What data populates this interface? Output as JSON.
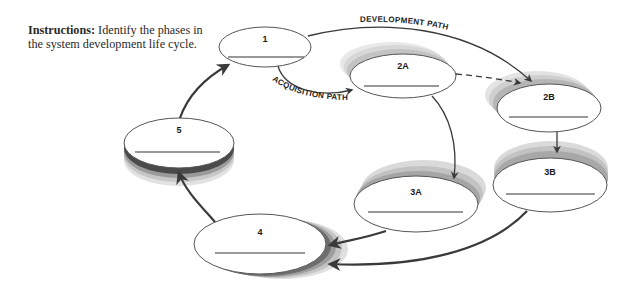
{
  "instructions": {
    "label": "Instructions:",
    "text": " Identify the phases in the system development life cycle."
  },
  "paths": {
    "development": "DEVELOPMENT PATH",
    "acquisition": "ACQUISITION PATH"
  },
  "phases": [
    {
      "id": "1",
      "answer": ""
    },
    {
      "id": "2A",
      "answer": ""
    },
    {
      "id": "2B",
      "answer": ""
    },
    {
      "id": "3A",
      "answer": ""
    },
    {
      "id": "3B",
      "answer": ""
    },
    {
      "id": "4",
      "answer": ""
    },
    {
      "id": "5",
      "answer": ""
    }
  ],
  "colors": {
    "arrow": "#3a3a3a",
    "ellipse_stroke": "#555555",
    "shadow": "#7a7a7a"
  }
}
